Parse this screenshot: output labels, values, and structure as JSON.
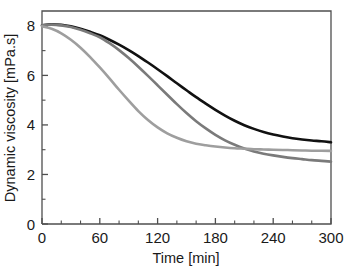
{
  "chart_data": {
    "type": "line",
    "title": "",
    "xlabel": "Time [min]",
    "ylabel": "Dynamic viscosity [mPa.s]",
    "xlim": [
      0,
      300
    ],
    "ylim": [
      0,
      8.6
    ],
    "xticks": [
      0,
      60,
      120,
      180,
      240,
      300
    ],
    "xtick_labels": [
      "0",
      "60",
      "120",
      "180",
      "240",
      "300"
    ],
    "yticks": [
      0,
      2,
      4,
      6,
      8
    ],
    "ytick_labels": [
      "0",
      "2",
      "4",
      "6",
      "8"
    ],
    "x_minor_tick_interval": 20,
    "y_minor_tick_interval": 1,
    "grid": false,
    "legend": false,
    "legend_position": "none",
    "frame": "box-open-left-bottom",
    "series": [
      {
        "name": "curve-black",
        "color": "#111111",
        "linewidth": 2.6,
        "x": [
          0,
          10,
          20,
          30,
          40,
          50,
          60,
          70,
          80,
          90,
          100,
          110,
          120,
          130,
          140,
          150,
          160,
          170,
          180,
          190,
          200,
          210,
          220,
          230,
          240,
          250,
          260,
          270,
          280,
          290,
          300
        ],
        "y": [
          8.02,
          8.06,
          8.04,
          7.98,
          7.88,
          7.76,
          7.62,
          7.44,
          7.24,
          7.02,
          6.78,
          6.52,
          6.25,
          5.97,
          5.68,
          5.4,
          5.12,
          4.86,
          4.61,
          4.38,
          4.17,
          3.99,
          3.84,
          3.71,
          3.61,
          3.53,
          3.46,
          3.41,
          3.37,
          3.34,
          3.3
        ]
      },
      {
        "name": "curve-medium-gray",
        "color": "#7a7a7a",
        "linewidth": 2.6,
        "x": [
          0,
          10,
          20,
          30,
          40,
          50,
          60,
          70,
          80,
          90,
          100,
          110,
          120,
          130,
          140,
          150,
          160,
          170,
          180,
          190,
          200,
          210,
          220,
          230,
          240,
          250,
          260,
          270,
          280,
          290,
          300
        ],
        "y": [
          8.02,
          8.05,
          8.02,
          7.95,
          7.84,
          7.7,
          7.54,
          7.3,
          7.02,
          6.7,
          6.35,
          5.98,
          5.6,
          5.22,
          4.84,
          4.48,
          4.15,
          3.86,
          3.6,
          3.38,
          3.2,
          3.05,
          2.93,
          2.84,
          2.77,
          2.71,
          2.66,
          2.62,
          2.58,
          2.55,
          2.52
        ]
      },
      {
        "name": "curve-light-gray",
        "color": "#9e9e9e",
        "linewidth": 2.6,
        "x": [
          0,
          10,
          20,
          30,
          40,
          50,
          60,
          70,
          80,
          90,
          100,
          110,
          120,
          130,
          140,
          150,
          160,
          170,
          180,
          190,
          200,
          210,
          220,
          230,
          240,
          250,
          260,
          270,
          280,
          290,
          300
        ],
        "y": [
          7.98,
          7.88,
          7.7,
          7.44,
          7.12,
          6.74,
          6.32,
          5.88,
          5.42,
          4.98,
          4.56,
          4.2,
          3.9,
          3.66,
          3.48,
          3.34,
          3.24,
          3.18,
          3.13,
          3.09,
          3.06,
          3.04,
          3.02,
          3.01,
          3.0,
          2.99,
          2.98,
          2.97,
          2.96,
          2.96,
          2.95
        ]
      }
    ]
  },
  "axes": {
    "x_title": "Time [min]",
    "y_title": "Dynamic viscosity [mPa.s]"
  },
  "ticks": {
    "x": [
      "0",
      "60",
      "120",
      "180",
      "240",
      "300"
    ],
    "y": [
      "0",
      "2",
      "4",
      "6",
      "8"
    ]
  },
  "colors": {
    "series_1": "#111111",
    "series_2": "#7a7a7a",
    "series_3": "#9e9e9e",
    "axis": "#4f4f4f",
    "text": "#1a1a1a",
    "background": "#ffffff"
  }
}
